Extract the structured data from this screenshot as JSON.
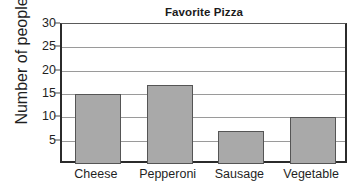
{
  "chart_data": {
    "type": "bar",
    "title": "Favorite Pizza",
    "xlabel": "",
    "ylabel": "Number of people",
    "categories": [
      "Cheese",
      "Pepperoni",
      "Sausage",
      "Vegetable"
    ],
    "values": [
      15,
      17,
      7,
      10
    ],
    "ylim": [
      0,
      30
    ],
    "yticks": [
      5,
      10,
      15,
      20,
      25,
      30
    ],
    "ytick_labels": [
      "5",
      "10",
      "15",
      "20",
      "25",
      "30"
    ],
    "grid": "horizontal",
    "legend": "none",
    "colors": {
      "bar_fill": "#a9a9a9",
      "bar_border": "#555555",
      "axis": "#2b2b2b",
      "gridline": "#9a9a9a",
      "text": "#1f1f1f",
      "background": "#ffffff"
    }
  }
}
